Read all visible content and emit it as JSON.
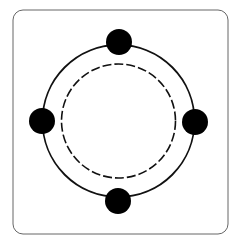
{
  "diagram": {
    "frame": {
      "x": 13,
      "y": 10,
      "width": 215,
      "height": 224,
      "radius": 10,
      "stroke": "#666666"
    },
    "outer_ring": {
      "cx": 118.5,
      "cy": 121,
      "r": 76,
      "stroke": "#111111",
      "style": "solid"
    },
    "inner_ring": {
      "cx": 118.5,
      "cy": 121,
      "r": 57,
      "stroke": "#111111",
      "style": "dashed"
    },
    "nodes": [
      {
        "name": "top",
        "cx": 119,
        "cy": 42,
        "r": 13,
        "fill": "#000000"
      },
      {
        "name": "right",
        "cx": 195,
        "cy": 122,
        "r": 13,
        "fill": "#000000"
      },
      {
        "name": "bottom",
        "cx": 118,
        "cy": 201,
        "r": 13,
        "fill": "#000000"
      },
      {
        "name": "left",
        "cx": 42,
        "cy": 121,
        "r": 13,
        "fill": "#000000"
      }
    ]
  }
}
